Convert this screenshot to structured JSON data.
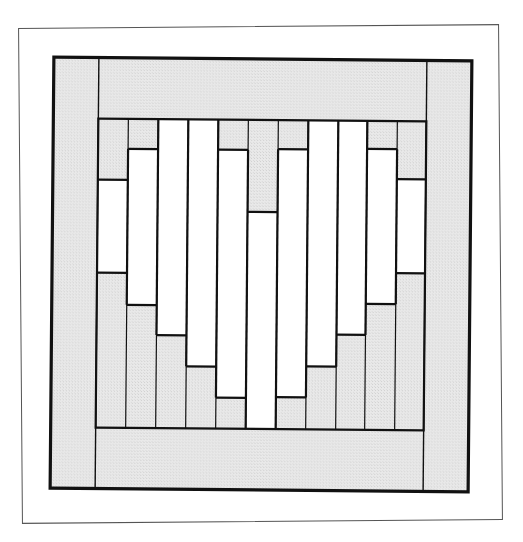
{
  "diagram": {
    "title": "",
    "type": "quilt-block",
    "colors": {
      "shaded": "#e4e4e4",
      "white": "#ffffff",
      "line": "#111111",
      "frame": "#555555"
    },
    "block": {
      "width": 418,
      "height": 431,
      "border_stroke": 3.2
    },
    "sashing": {
      "left_x": 45,
      "right_x": 373,
      "top_y": 61,
      "bottom_y": 370
    },
    "columns": [
      {
        "index": 1,
        "x0": 45,
        "x1": 75,
        "white_top": 122,
        "white_bottom": 215
      },
      {
        "index": 2,
        "x0": 75,
        "x1": 105,
        "white_top": 91,
        "white_bottom": 247
      },
      {
        "index": 3,
        "x0": 105,
        "x1": 135,
        "white_top": 61,
        "white_bottom": 277
      },
      {
        "index": 4,
        "x0": 135,
        "x1": 165,
        "white_top": 61,
        "white_bottom": 308
      },
      {
        "index": 5,
        "x0": 165,
        "x1": 195,
        "white_top": 91,
        "white_bottom": 339
      },
      {
        "index": 6,
        "x0": 195,
        "x1": 225,
        "white_top": 153,
        "white_bottom": 370
      },
      {
        "index": 7,
        "x0": 225,
        "x1": 255,
        "white_top": 90,
        "white_bottom": 338
      },
      {
        "index": 8,
        "x0": 255,
        "x1": 285,
        "white_top": 61,
        "white_bottom": 307
      },
      {
        "index": 9,
        "x0": 285,
        "x1": 314,
        "white_top": 61,
        "white_bottom": 275
      },
      {
        "index": 10,
        "x0": 314,
        "x1": 344,
        "white_top": 89,
        "white_bottom": 244
      },
      {
        "index": 11,
        "x0": 344,
        "x1": 373,
        "white_top": 119,
        "white_bottom": 213
      }
    ]
  }
}
